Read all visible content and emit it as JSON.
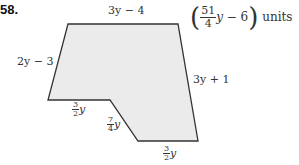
{
  "problem": {
    "number": "58.",
    "perimeter": {
      "numerator": "51",
      "denominator": "4",
      "variable": "y",
      "constant": " − 6",
      "units": "units"
    },
    "sides": {
      "top": "3y − 4",
      "left": "2y − 3",
      "right": "3y + 1",
      "lower_left": {
        "numerator": "3",
        "denominator": "2",
        "variable": "y"
      },
      "slant": {
        "numerator": "7",
        "denominator": "4",
        "variable": "y"
      },
      "bottom": {
        "numerator": "3",
        "denominator": "2",
        "variable": "y"
      }
    },
    "colors": {
      "fill": "#ebebeb",
      "stroke": "#333333"
    }
  }
}
